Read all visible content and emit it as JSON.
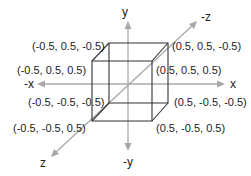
{
  "diagram": {
    "colors": {
      "axis": "#a8a8a8",
      "edge": "#333333",
      "text": "#222222",
      "background": "#ffffff"
    },
    "axes": {
      "y_pos": "y",
      "y_neg": "-y",
      "x_pos": "x",
      "x_neg": "-x",
      "z_pos": "z",
      "z_neg": "-z"
    },
    "vertices": {
      "back_top_left": "(-0.5, 0.5, -0.5)",
      "front_top_left": "(-0.5, 0.5, 0.5)",
      "back_top_right": "(0.5, 0.5, -0.5)",
      "front_top_right": "(0.5, 0.5, 0.5)",
      "back_bottom_left": "(-0.5, -0.5, -0.5)",
      "front_bottom_left": "(-0.5, -0.5, 0.5)",
      "back_bottom_right": "(0.5, -0.5, -0.5)",
      "front_bottom_right": "(0.5, -0.5, 0.5)"
    }
  }
}
